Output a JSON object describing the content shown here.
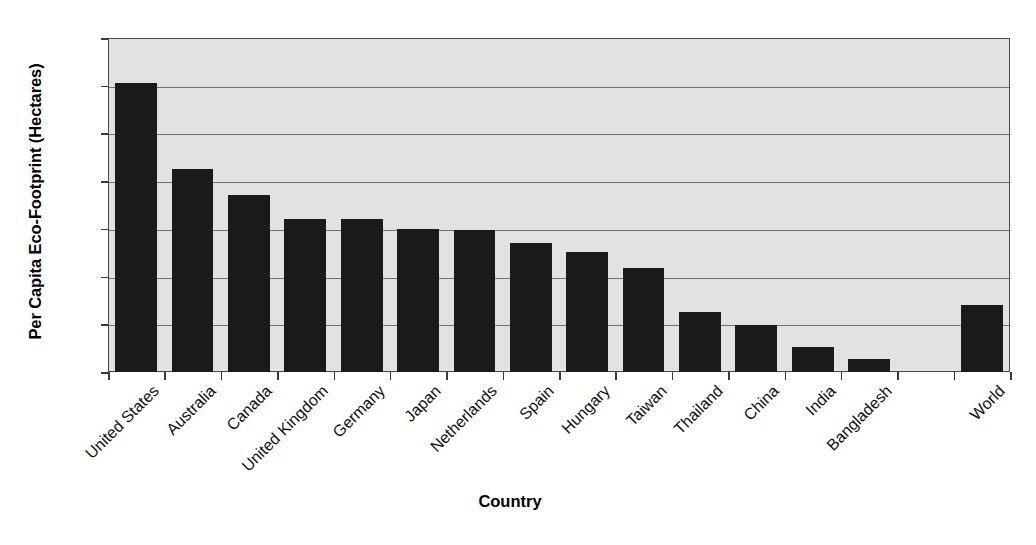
{
  "chart_data": {
    "type": "bar",
    "title": "",
    "xlabel": "Country",
    "ylabel": "Per Capita Eco-Footprint (Hectares)",
    "categories": [
      "United States",
      "Australia",
      "Canada",
      "United Kingdom",
      "Germany",
      "Japan",
      "Netherlands",
      "Spain",
      "Hungary",
      "Taiwan",
      "Thailand",
      "China",
      "India",
      "Bangladesh",
      "",
      "World"
    ],
    "values": [
      12.1,
      8.5,
      7.4,
      6.4,
      6.4,
      6.0,
      5.95,
      5.4,
      5.05,
      4.35,
      2.5,
      1.95,
      1.05,
      0.55,
      null,
      2.8
    ],
    "ylim": [
      0,
      14
    ],
    "ytick_values": [
      0,
      2,
      4,
      6,
      8,
      10,
      12,
      14
    ],
    "ytick_labels": [
      "0",
      "2",
      "4",
      "6",
      "8",
      "10",
      "12",
      "14"
    ],
    "grid": true,
    "legend": false,
    "bar_color": "#1a1a1a",
    "plot_background": "#e2e2e2",
    "gridline_color": "#70706e",
    "axis_color": "#4a4a4a"
  }
}
